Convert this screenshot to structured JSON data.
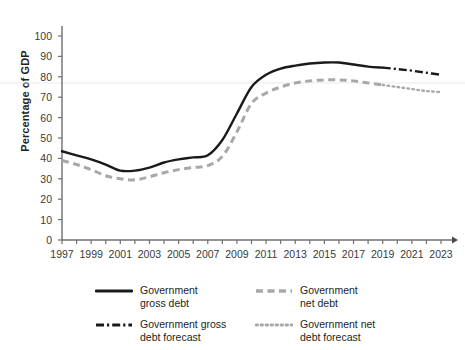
{
  "chart_data": {
    "type": "line",
    "title": "",
    "xlabel": "",
    "ylabel": "Percentage of GDP",
    "ylim": [
      0,
      105
    ],
    "yticks": [
      0,
      10,
      20,
      30,
      40,
      50,
      60,
      70,
      80,
      90,
      100
    ],
    "ytick_labels": [
      "0",
      "10",
      "20",
      "30",
      "40",
      "50",
      "60",
      "70",
      "80",
      "90",
      "100"
    ],
    "xlim": [
      1997,
      2023
    ],
    "xticks": [
      1997,
      1998,
      1999,
      2000,
      2001,
      2002,
      2003,
      2004,
      2005,
      2006,
      2007,
      2008,
      2009,
      2010,
      2011,
      2012,
      2013,
      2014,
      2015,
      2016,
      2017,
      2018,
      2019,
      2020,
      2021,
      2022,
      2023
    ],
    "xtick_labels": [
      "1997",
      "1999",
      "2001",
      "2003",
      "2005",
      "2007",
      "2009",
      "2011",
      "2013",
      "2015",
      "2017",
      "2019",
      "2021",
      "2023"
    ],
    "xtick_labelled_years": [
      1997,
      1999,
      2001,
      2003,
      2005,
      2007,
      2009,
      2011,
      2013,
      2015,
      2017,
      2019,
      2021,
      2023
    ],
    "grid": false,
    "legend_position": "bottom",
    "series": [
      {
        "name": "Government gross debt",
        "style": "solid",
        "color": "#1a1a1a",
        "x": [
          1997,
          1998,
          1999,
          2000,
          2001,
          2002,
          2003,
          2004,
          2005,
          2006,
          2007,
          2008,
          2009,
          2010,
          2011,
          2012,
          2013,
          2014,
          2015,
          2016,
          2017,
          2018,
          2019
        ],
        "values": [
          43.5,
          41.5,
          39.5,
          37,
          34,
          34,
          35.5,
          38,
          39.5,
          40.5,
          41.5,
          49,
          62,
          75,
          81,
          84,
          85.5,
          86.5,
          87,
          87,
          86,
          85,
          84.5
        ]
      },
      {
        "name": "Government net debt",
        "style": "dashed",
        "color": "#a8a8a8",
        "x": [
          1997,
          1998,
          1999,
          2000,
          2001,
          2002,
          2003,
          2004,
          2005,
          2006,
          2007,
          2008,
          2009,
          2010,
          2011,
          2012,
          2013,
          2014,
          2015,
          2016,
          2017,
          2018,
          2019
        ],
        "values": [
          39,
          37,
          34.5,
          31.5,
          30,
          29.5,
          31,
          33,
          34.5,
          35.5,
          36.5,
          41,
          53,
          67,
          72,
          75,
          77,
          78,
          78.5,
          78.5,
          78,
          77,
          76
        ]
      },
      {
        "name": "Government gross debt forecast",
        "style": "dash-dot",
        "color": "#1a1a1a",
        "x": [
          2019,
          2020,
          2021,
          2022,
          2023
        ],
        "values": [
          84.5,
          83.8,
          83,
          82,
          81
        ]
      },
      {
        "name": "Government net debt forecast",
        "style": "dotted",
        "color": "#a8a8a8",
        "x": [
          2019,
          2020,
          2021,
          2022,
          2023
        ],
        "values": [
          76,
          75,
          74,
          73,
          72.5
        ]
      }
    ]
  },
  "legend": {
    "items": [
      {
        "label": "Government\ngross debt",
        "style": "solid",
        "color": "#1a1a1a"
      },
      {
        "label": "Government\nnet debt",
        "style": "dashed",
        "color": "#a8a8a8"
      },
      {
        "label": "Government gross\ndebt forecast",
        "style": "dash-dot",
        "color": "#1a1a1a"
      },
      {
        "label": "Government net\ndebt forecast",
        "style": "dotted",
        "color": "#a8a8a8"
      }
    ]
  }
}
